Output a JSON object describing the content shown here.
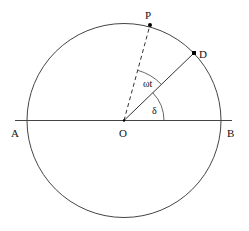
{
  "diagram": {
    "title": "",
    "stroke_color": "#333333",
    "dot_color": "#000000",
    "circle": {
      "cx": 124,
      "cy": 120.5,
      "r": 97
    },
    "axis": {
      "x1": 15,
      "y1": 120.5,
      "x2": 232,
      "y2": 120.5
    },
    "points": {
      "O": {
        "label": "O",
        "x": 124,
        "y": 120.5
      },
      "P": {
        "label": "P",
        "x": 150,
        "y": 25
      },
      "D": {
        "label": "D",
        "x": 194,
        "y": 53
      },
      "A": {
        "label": "A",
        "x": 28,
        "y": 120.5
      },
      "B": {
        "label": "B",
        "x": 220,
        "y": 120.5
      }
    },
    "angles": {
      "omega_t": {
        "label": "ωt",
        "radius": 52
      },
      "delta": {
        "label": "δ",
        "radius": 40
      }
    },
    "lines": {
      "OP": {
        "style": "dashed"
      },
      "OD": {
        "style": "solid"
      }
    }
  }
}
